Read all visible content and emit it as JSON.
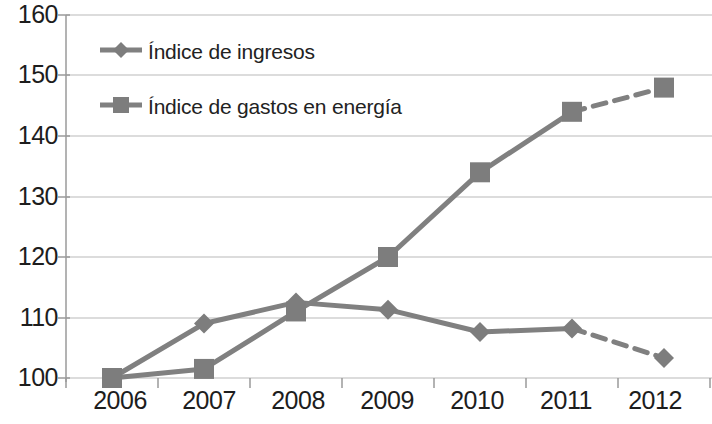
{
  "chart_data": {
    "type": "line",
    "title": "",
    "xlabel": "",
    "ylabel": "",
    "categories": [
      "2006",
      "2007",
      "2008",
      "2009",
      "2010",
      "2011",
      "2012"
    ],
    "ylim": [
      100,
      160
    ],
    "ytick_step": 10,
    "yticks": [
      "100",
      "110",
      "120",
      "130",
      "140",
      "150",
      "160"
    ],
    "grid": true,
    "legend_position": "inside-top-left",
    "line_color": "#808080",
    "series": [
      {
        "name": "Índice de ingresos",
        "marker": "diamond",
        "values": [
          100,
          109,
          112.5,
          111.3,
          107.6,
          108.2,
          103.3
        ],
        "dashed_from_index": 5
      },
      {
        "name": "Índice de gastos en energía",
        "marker": "square",
        "values": [
          100,
          101.5,
          111,
          120,
          134,
          144,
          148
        ],
        "dashed_from_index": 5
      }
    ]
  },
  "legend": {
    "items": [
      {
        "label": "Índice de ingresos"
      },
      {
        "label": "Índice de gastos en energía"
      }
    ]
  },
  "axis": {
    "y_ticks": [
      "160",
      "150",
      "140",
      "130",
      "120",
      "110",
      "100"
    ],
    "x_ticks": [
      "2006",
      "2007",
      "2008",
      "2009",
      "2010",
      "2011",
      "2012"
    ]
  }
}
